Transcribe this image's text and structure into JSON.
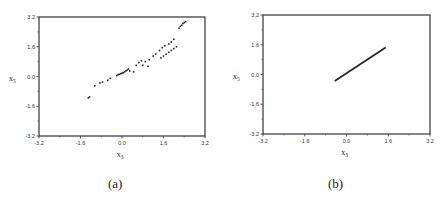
{
  "chart_data": [
    {
      "panel": "(a)",
      "type": "scatter",
      "title": "",
      "caption": "(a)",
      "xlabel": "x3",
      "ylabel": "x5",
      "xlabel_main": "x",
      "xlabel_sub": "3",
      "ylabel_main": "x",
      "ylabel_sub": "5",
      "xlim": [
        -3.2,
        3.2
      ],
      "ylim": [
        -3.2,
        3.2
      ],
      "xticks": [
        -3.2,
        -1.6,
        0.0,
        1.6,
        3.2
      ],
      "yticks": [
        -3.2,
        -1.6,
        0.0,
        1.6,
        3.2
      ],
      "xtick_labels": [
        "-3.2",
        "-1.6",
        "0.0",
        "1.6",
        "3.2"
      ],
      "ytick_labels": [
        "-3.2",
        "-1.6",
        "0.0",
        "1.6",
        "3.2"
      ],
      "grid": false,
      "points": [
        [
          -1.3,
          -1.15
        ],
        [
          -1.25,
          -1.1
        ],
        [
          -1.05,
          -0.5
        ],
        [
          -0.85,
          -0.35
        ],
        [
          -0.75,
          -0.3
        ],
        [
          -0.55,
          -0.2
        ],
        [
          -0.45,
          -0.1
        ],
        [
          -0.2,
          0.05
        ],
        [
          -0.15,
          0.1
        ],
        [
          -0.1,
          0.12
        ],
        [
          -0.05,
          0.15
        ],
        [
          0.0,
          0.18
        ],
        [
          0.05,
          0.2
        ],
        [
          0.1,
          0.25
        ],
        [
          0.15,
          0.3
        ],
        [
          0.2,
          0.35
        ],
        [
          0.25,
          0.4
        ],
        [
          0.3,
          0.3
        ],
        [
          0.45,
          0.25
        ],
        [
          0.55,
          0.6
        ],
        [
          0.65,
          0.75
        ],
        [
          0.75,
          0.85
        ],
        [
          0.8,
          0.6
        ],
        [
          0.9,
          0.8
        ],
        [
          1.0,
          0.55
        ],
        [
          1.05,
          0.9
        ],
        [
          1.2,
          1.1
        ],
        [
          1.3,
          1.2
        ],
        [
          1.45,
          1.4
        ],
        [
          1.55,
          1.55
        ],
        [
          1.65,
          1.65
        ],
        [
          1.8,
          1.75
        ],
        [
          1.9,
          1.85
        ],
        [
          2.0,
          2.0
        ],
        [
          1.5,
          1.0
        ],
        [
          1.6,
          1.1
        ],
        [
          1.7,
          1.2
        ],
        [
          1.8,
          1.3
        ],
        [
          1.9,
          1.4
        ],
        [
          2.0,
          1.5
        ],
        [
          2.1,
          1.6
        ],
        [
          2.2,
          2.6
        ],
        [
          2.25,
          2.7
        ],
        [
          2.3,
          2.75
        ],
        [
          2.35,
          2.85
        ],
        [
          2.4,
          2.9
        ],
        [
          2.45,
          2.95
        ]
      ]
    },
    {
      "panel": "(b)",
      "type": "line",
      "title": "",
      "caption": "(b)",
      "xlabel": "x3",
      "ylabel": "x5",
      "xlabel_main": "x",
      "xlabel_sub": "3",
      "ylabel_main": "x",
      "ylabel_sub": "5",
      "xlim": [
        -3.2,
        3.2
      ],
      "ylim": [
        -3.2,
        3.2
      ],
      "xticks": [
        -3.2,
        -1.6,
        0.0,
        1.6,
        3.2
      ],
      "yticks": [
        -3.2,
        -1.6,
        0.0,
        1.6,
        3.2
      ],
      "xtick_labels": [
        "-3.2",
        "-1.6",
        "0.0",
        "1.6",
        "3.2"
      ],
      "ytick_labels": [
        "-3.2",
        "-1.6",
        "0.0",
        "1.6",
        "3.2"
      ],
      "grid": false,
      "x": [
        -0.45,
        1.5
      ],
      "y": [
        -0.35,
        1.45
      ]
    }
  ]
}
